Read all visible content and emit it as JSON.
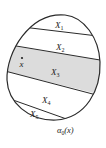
{
  "diagram": {
    "regions": [
      {
        "label": "X",
        "sub": "1",
        "shaded": false
      },
      {
        "label": "X",
        "sub": "2",
        "shaded": false
      },
      {
        "label": "X",
        "sub": "3",
        "shaded": true
      },
      {
        "label": "X",
        "sub": "4",
        "shaded": false
      },
      {
        "label": "X",
        "sub": "5",
        "shaded": false
      }
    ],
    "point_label": "x",
    "caption": {
      "alpha": "α",
      "sub": "0",
      "arg": "(x)"
    },
    "colors": {
      "shade": "#dcdcdc",
      "stroke": "#2a2a2a",
      "background": "#ffffff"
    }
  }
}
